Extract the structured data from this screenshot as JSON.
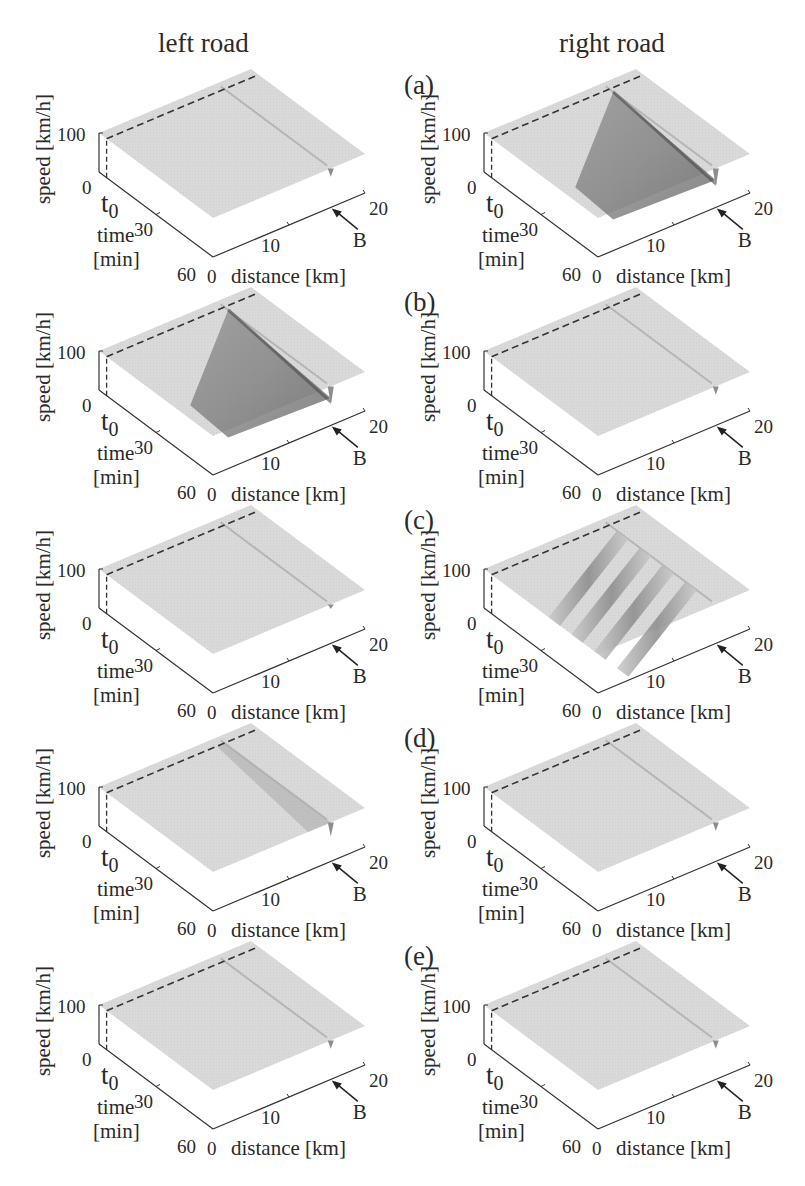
{
  "figure": {
    "column_titles": [
      "left road",
      "right road"
    ],
    "panel_labels": [
      "(a)",
      "(b)",
      "(c)",
      "(d)",
      "(e)"
    ]
  },
  "chart_data": {
    "type": "surface3d",
    "axes": {
      "zlabel": "speed [km/h]",
      "xlabel": "time\n[min]",
      "ylabel": "distance [km]",
      "z_ticks": [
        "0",
        "100"
      ],
      "x_ticks": [
        "0",
        "30",
        "60"
      ],
      "y_ticks": [
        "0",
        "10",
        "20"
      ],
      "t0_label": "t0",
      "bottleneck_label": "B",
      "time_range": [
        0,
        60
      ],
      "distance_range": [
        0,
        20
      ],
      "speed_range": [
        0,
        100
      ]
    },
    "panels": [
      {
        "row": "(a)",
        "road": "left",
        "congestion": "none",
        "dip_at_B": "small",
        "free_speed": 100
      },
      {
        "row": "(a)",
        "road": "right",
        "congestion": "wide jam triangle",
        "dip_at_B": "large",
        "free_speed": 100
      },
      {
        "row": "(b)",
        "road": "left",
        "congestion": "wide jam triangle",
        "dip_at_B": "large",
        "free_speed": 100
      },
      {
        "row": "(b)",
        "road": "right",
        "congestion": "none",
        "dip_at_B": "small",
        "free_speed": 100
      },
      {
        "row": "(c)",
        "road": "left",
        "congestion": "none",
        "dip_at_B": "tiny",
        "free_speed": 100
      },
      {
        "row": "(c)",
        "road": "right",
        "congestion": "stop-and-go waves",
        "dip_at_B": "none",
        "free_speed": 100
      },
      {
        "row": "(d)",
        "road": "left",
        "congestion": "light band near B",
        "dip_at_B": "medium",
        "free_speed": 100
      },
      {
        "row": "(d)",
        "road": "right",
        "congestion": "none",
        "dip_at_B": "small",
        "free_speed": 100
      },
      {
        "row": "(e)",
        "road": "left",
        "congestion": "none",
        "dip_at_B": "small",
        "free_speed": 100
      },
      {
        "row": "(e)",
        "road": "right",
        "congestion": "none",
        "dip_at_B": "small",
        "free_speed": 100
      }
    ]
  }
}
